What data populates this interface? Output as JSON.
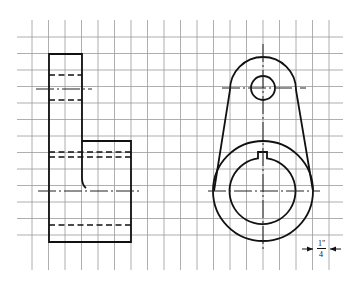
{
  "drawing": {
    "type": "orthographic two-view sketch on grid paper",
    "grid": {
      "origin_x": 32,
      "origin_y": 37,
      "spacing": 16.5,
      "cols": 20,
      "rows": 13,
      "line_color": "#9a9a9a"
    },
    "views": [
      {
        "name": "side-view",
        "description": "stepped rectangular profile with hidden bore lines"
      },
      {
        "name": "front-view",
        "description": "lever arm with small hole, large hub with keyed bore"
      }
    ],
    "dimension": {
      "label_numerator": "1\"",
      "label_denominator": "4",
      "meaning": "grid square = 1/4 inch"
    },
    "colors": {
      "line": "#111111",
      "background": "#ffffff"
    }
  }
}
